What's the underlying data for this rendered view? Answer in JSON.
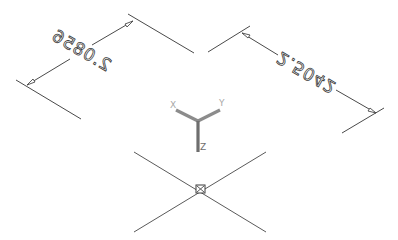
{
  "app": {
    "view": "isometric-model-space"
  },
  "dimensions": [
    {
      "id": "dim-left",
      "value": "2.0856",
      "mirrored": true
    },
    {
      "id": "dim-right",
      "value": "2.5042",
      "mirrored": true
    }
  ],
  "ucs_icon": {
    "x_label": "X",
    "y_label": "Y",
    "z_label": "Z"
  },
  "cursor": {
    "type": "crosshair-with-pickbox"
  },
  "colors": {
    "background": "#ffffff",
    "lines": "#4a4a4a",
    "ucs": "#8c8c8c"
  }
}
